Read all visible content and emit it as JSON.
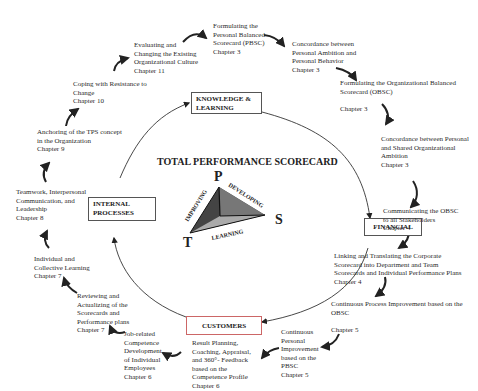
{
  "diagram": {
    "title": "TOTAL PERFORMANCE SCORECARD",
    "perspectives": {
      "knowledge": "KNOWLEDGE &\nLEARNING",
      "financial": "FINANCIAL",
      "customers": "CUSTOMERS",
      "internal": "INTERNAL\nPROCESSES"
    },
    "triangle": {
      "vertices": {
        "top": "P",
        "right": "S",
        "left": "T"
      },
      "edges": {
        "left": "IMPROVING",
        "right": "DEVELOPING",
        "bottom": "LEARNING"
      }
    },
    "steps": [
      {
        "id": "pbsc",
        "text": "Formulating the\nPersonal Balanced\nScorecard (PBSC)\nChapter 3"
      },
      {
        "id": "concordance-personal",
        "text": "Concordance between\nPersonal Ambition and\nPersonal Behavior\nChapter 3"
      },
      {
        "id": "obsc",
        "text": "Formulating the Organizational Balanced\nScorecard (OBSC)\n\nChapter 3"
      },
      {
        "id": "concordance-shared",
        "text": "Concordance between Personal\nand Shared Organizational\nAmbition\nChapter 3"
      },
      {
        "id": "communicating",
        "text": "Communicating the OBSC\nto all Stakeholders\nChapter 4"
      },
      {
        "id": "linking",
        "text": "Linking and Translating  the Corporate\nScorecard into Department and Team\nScorecards and Individual Performance Plans\nChapter 4"
      },
      {
        "id": "cpi",
        "text": "Continuous Process Improvement based on the\nOBSC\n\nChapter 5"
      },
      {
        "id": "cpersonal",
        "text": "Continuous\nPersonal\nImprovement\nbased on the\nPBSC\nChapter 5"
      },
      {
        "id": "result-planning",
        "text": "Result Planning,\nCoaching, Appraisal,\nand 360°- Feedback\nbased on the\nCompetence Profile\nChapter 6"
      },
      {
        "id": "job-related",
        "text": "Job-related\nCompetence\nDevelopment\nof Individual\nEmployees\nChapter 6"
      },
      {
        "id": "reviewing",
        "text": "Reviewing and\nActualizing of the\nScorecards and\nPerformance plans\nChapter 7"
      },
      {
        "id": "individual-learning",
        "text": "Individual and\nCollective Learning\nChapter 7"
      },
      {
        "id": "teamwork",
        "text": "Teamwork, Interpersonal\nCommunication, and\nLeadership\nChapter 8"
      },
      {
        "id": "anchoring",
        "text": "Anchoring of the TPS concept\nin the Organization\nChapter 9"
      },
      {
        "id": "resistance",
        "text": "Coping with Resistance to\nChange\nChapter 10"
      },
      {
        "id": "culture",
        "text": "Evaluating and\nChanging  the Existing\nOrganizational Culture\nChapter 11"
      }
    ]
  }
}
